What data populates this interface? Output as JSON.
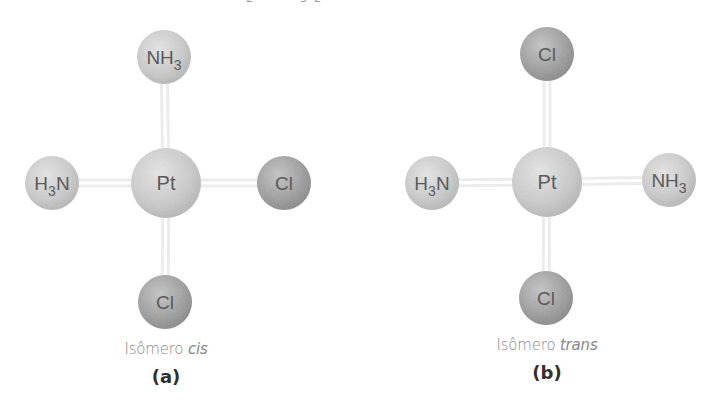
{
  "header": {
    "clipped_formula_fragments": [
      {
        "text": "2",
        "x": 246
      },
      {
        "text": "3",
        "x": 300
      },
      {
        "text": "2",
        "x": 314
      }
    ]
  },
  "colors": {
    "light_sphere": "#cbcbcb",
    "light_sphere_highlight": "#e4e4e4",
    "dark_sphere": "#9c9c9c",
    "dark_sphere_highlight": "#c4c4c4",
    "bond": "#ececec",
    "label": "#5a5a5a",
    "caption": "#8a8a8a"
  },
  "panels": [
    {
      "id": "a",
      "letter": "(a)",
      "caption_prefix": "Isômero ",
      "caption_italic": "cis",
      "center": {
        "atom": "Pt",
        "x": 166,
        "y": 183,
        "r": 35
      },
      "ligands": [
        {
          "position": "top",
          "label": "NH",
          "sub": "3",
          "sub_after": true,
          "x": 164,
          "y": 57,
          "r": 27,
          "shade": "light"
        },
        {
          "position": "left",
          "label": "N",
          "prefix": "H",
          "sub": "3",
          "sub_after": false,
          "x": 52,
          "y": 183,
          "r": 27,
          "shade": "light"
        },
        {
          "position": "right",
          "label": "Cl",
          "x": 284,
          "y": 183,
          "r": 27,
          "shade": "dark"
        },
        {
          "position": "bottom",
          "label": "Cl",
          "x": 165,
          "y": 302,
          "r": 27,
          "shade": "dark"
        }
      ],
      "caption_x": 166,
      "caption_y": 340,
      "letter_y": 366
    },
    {
      "id": "b",
      "letter": "(b)",
      "caption_prefix": "Isômero ",
      "caption_italic": "trans",
      "center": {
        "atom": "Pt",
        "x": 547,
        "y": 182,
        "r": 35
      },
      "ligands": [
        {
          "position": "top",
          "label": "Cl",
          "x": 547,
          "y": 54,
          "r": 27,
          "shade": "dark"
        },
        {
          "position": "left",
          "label": "N",
          "prefix": "H",
          "sub": "3",
          "sub_after": false,
          "x": 432,
          "y": 183,
          "r": 27,
          "shade": "light"
        },
        {
          "position": "right",
          "label": "NH",
          "sub": "3",
          "sub_after": true,
          "x": 669,
          "y": 180,
          "r": 27,
          "shade": "light"
        },
        {
          "position": "bottom",
          "label": "Cl",
          "x": 546,
          "y": 298,
          "r": 27,
          "shade": "dark"
        }
      ],
      "caption_x": 547,
      "caption_y": 336,
      "letter_y": 362
    }
  ]
}
